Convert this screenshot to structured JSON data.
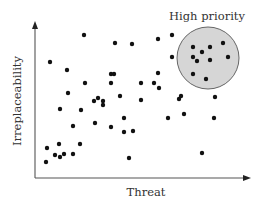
{
  "chart_data": {
    "type": "scatter",
    "title": "",
    "xlabel": "Threat",
    "ylabel": "Irreplaceability",
    "grid": false,
    "ticks": false,
    "legend": null,
    "annotations": [
      {
        "text": "High priority",
        "type": "circle",
        "region": "high threat, high irreplaceability",
        "center_px": [
          208,
          58
        ],
        "radius_px": 31,
        "fill": "#d6d6d6",
        "stroke": "#666666"
      }
    ],
    "axis_px": {
      "origin": [
        35,
        178
      ],
      "x_end": [
        250,
        178
      ],
      "y_end": [
        35,
        22
      ]
    },
    "points_px": [
      [
        84,
        35
      ],
      [
        50,
        62
      ],
      [
        67,
        70
      ],
      [
        115,
        43
      ],
      [
        132,
        44
      ],
      [
        158,
        39
      ],
      [
        111,
        74
      ],
      [
        114,
        74
      ],
      [
        158,
        73
      ],
      [
        172,
        35
      ],
      [
        172,
        57
      ],
      [
        193,
        47
      ],
      [
        202,
        52
      ],
      [
        210,
        47
      ],
      [
        223,
        43
      ],
      [
        228,
        57
      ],
      [
        193,
        57
      ],
      [
        197,
        61
      ],
      [
        210,
        60
      ],
      [
        193,
        74
      ],
      [
        206,
        79
      ],
      [
        181,
        96
      ],
      [
        215,
        97
      ],
      [
        68,
        93
      ],
      [
        85,
        83
      ],
      [
        111,
        83
      ],
      [
        141,
        83
      ],
      [
        154,
        83
      ],
      [
        159,
        88
      ],
      [
        94,
        101
      ],
      [
        98,
        98
      ],
      [
        103,
        101
      ],
      [
        120,
        96
      ],
      [
        141,
        100
      ],
      [
        103,
        105
      ],
      [
        179,
        99
      ],
      [
        60,
        109
      ],
      [
        81,
        110
      ],
      [
        73,
        126
      ],
      [
        95,
        123
      ],
      [
        111,
        127
      ],
      [
        124,
        118
      ],
      [
        124,
        132
      ],
      [
        133,
        131
      ],
      [
        168,
        118
      ],
      [
        184,
        114
      ],
      [
        214,
        118
      ],
      [
        202,
        153
      ],
      [
        129,
        158
      ],
      [
        47,
        148
      ],
      [
        59,
        144
      ],
      [
        55,
        155
      ],
      [
        60,
        157
      ],
      [
        64,
        154
      ],
      [
        73,
        154
      ],
      [
        80,
        144
      ],
      [
        46,
        162
      ]
    ]
  },
  "labels": {
    "x_axis": "Threat",
    "y_axis": "Irreplaceability",
    "highlight": "High priority"
  },
  "colors": {
    "dot": "#111111",
    "circle_fill": "#d6d6d6",
    "circle_stroke": "#666666",
    "axis": "#555555",
    "text": "#333333"
  }
}
